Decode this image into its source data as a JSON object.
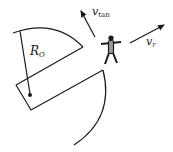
{
  "diagram": {
    "labels": {
      "radius": {
        "main": "R",
        "sub": "O"
      },
      "v_tan": {
        "main": "v",
        "sub": "tan"
      },
      "v_r": {
        "main": "v",
        "sub": "r"
      }
    },
    "colors": {
      "stroke": "#1a1a1a",
      "figure_fill": "#9a9a9a",
      "background": "#ffffff"
    },
    "elements": [
      "upper-arc",
      "wedge-edge",
      "rectangle-arm",
      "radius-line",
      "center-dot",
      "lower-arc",
      "v-tan-arrow",
      "astronaut-figure",
      "v-r-arrow"
    ]
  }
}
